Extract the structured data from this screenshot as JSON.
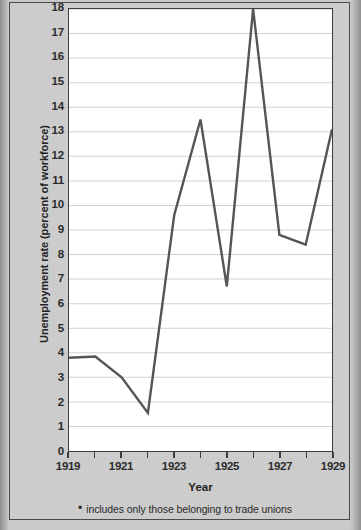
{
  "figure": {
    "background_color": "#c9c9c9",
    "plot_background_color": "#ffffff",
    "frame_color": "#4a4a4a",
    "line_color": "#555555",
    "gridline_color": "#d2d2d2",
    "footnote_marker": "•",
    "footnote_text": "includes only those belonging to trade unions"
  },
  "chart_data": {
    "type": "line",
    "title": "",
    "xlabel": "Year",
    "ylabel": "Unemployment rate (percent of workforce)",
    "x": [
      1919,
      1920,
      1921,
      1922,
      1923,
      1924,
      1925,
      1926,
      1927,
      1928,
      1929
    ],
    "values": [
      3.8,
      3.85,
      3.0,
      1.55,
      9.6,
      13.5,
      6.7,
      18.0,
      8.8,
      8.4,
      13.1
    ],
    "series": [
      {
        "name": "Unemployment rate",
        "values": [
          3.8,
          3.85,
          3.0,
          1.55,
          9.6,
          13.5,
          6.7,
          18.0,
          8.8,
          8.4,
          13.1
        ]
      }
    ],
    "xlim": [
      1919,
      1929
    ],
    "ylim": [
      0,
      18
    ],
    "ytick_labels": [
      "0",
      "1",
      "2",
      "3",
      "4",
      "5",
      "6",
      "7",
      "8",
      "9",
      "10",
      "11",
      "12",
      "13",
      "14",
      "15",
      "16",
      "17",
      "18"
    ],
    "ytick_values": [
      0,
      1,
      2,
      3,
      4,
      5,
      6,
      7,
      8,
      9,
      10,
      11,
      12,
      13,
      14,
      15,
      16,
      17,
      18
    ],
    "xtick_values": [
      1919,
      1920,
      1921,
      1922,
      1923,
      1924,
      1925,
      1926,
      1927,
      1928,
      1929
    ],
    "xtick_labels_shown": [
      "1919",
      "1921",
      "1923",
      "1925",
      "1927",
      "1929"
    ],
    "xtick_label_values": [
      1919,
      1921,
      1923,
      1925,
      1927,
      1929
    ],
    "grid": true,
    "grid_axis": "y",
    "legend": false,
    "legend_position": "none"
  }
}
